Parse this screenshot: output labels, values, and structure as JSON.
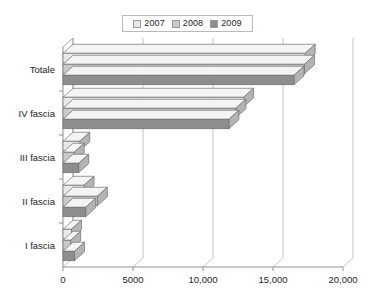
{
  "chart_data": {
    "type": "bar",
    "orientation": "horizontal",
    "title": "",
    "xlabel": "",
    "ylabel": "",
    "categories": [
      "I fascia",
      "II fascia",
      "III fascia",
      "IV fascia",
      "Totale"
    ],
    "series": [
      {
        "name": "2007",
        "color": "#e9e9e9",
        "values": [
          600,
          1500,
          1200,
          12900,
          17300
        ]
      },
      {
        "name": "2008",
        "color": "#c9c9c9",
        "values": [
          550,
          2450,
          800,
          12350,
          17250
        ]
      },
      {
        "name": "2009",
        "color": "#8d8d8d",
        "values": [
          820,
          1620,
          1120,
          11850,
          16500
        ]
      }
    ],
    "xlim": [
      0,
      20000
    ],
    "xticks": [
      0,
      5000,
      10000,
      15000,
      20000
    ],
    "xtick_labels": [
      "0",
      "5000",
      "10,000",
      "15,000",
      "20,000"
    ],
    "grid": true,
    "grid_axis": "x",
    "legend": {
      "position": "top-center",
      "entries": [
        "2007",
        "2008",
        "2009"
      ]
    },
    "style": "3d-bar"
  },
  "legend": {
    "entries": [
      {
        "label": "2007",
        "swatch": "legend-swatch-2007"
      },
      {
        "label": "2008",
        "swatch": "legend-swatch-2008"
      },
      {
        "label": "2009",
        "swatch": "legend-swatch-2009"
      }
    ]
  },
  "axes": {
    "y_categories": [
      "Totale",
      "IV fascia",
      "III fascia",
      "II fascia",
      "I fascia"
    ],
    "x_tick_labels": [
      "0",
      "5000",
      "10,000",
      "15,000",
      "20,000"
    ]
  },
  "colors": {
    "series_2007": "#e9e9e9",
    "series_2008": "#c9c9c9",
    "series_2009": "#8d8d8d",
    "grid": "#b5b5b5",
    "axis": "#8f8f8f",
    "bar_outline": "#6f6f6f",
    "text": "#1d1d1d"
  }
}
